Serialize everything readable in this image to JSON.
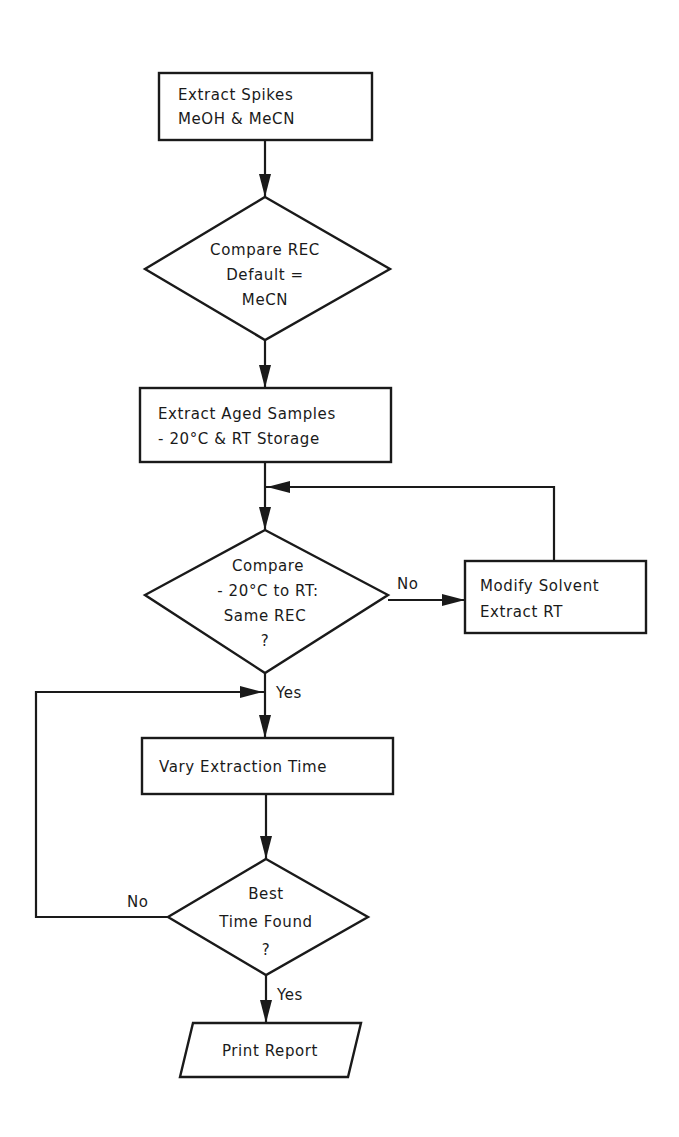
{
  "diagram": {
    "type": "flowchart",
    "nodes": [
      {
        "id": "extract_spikes",
        "shape": "process",
        "lines": [
          "Extract Spikes",
          "MeOH & MeCN"
        ]
      },
      {
        "id": "compare_rec_default",
        "shape": "decision",
        "lines": [
          "Compare REC",
          "Default =",
          "MeCN"
        ]
      },
      {
        "id": "extract_aged",
        "shape": "process",
        "lines": [
          "Extract Aged Samples",
          "- 20°C & RT Storage"
        ]
      },
      {
        "id": "compare_temps",
        "shape": "decision",
        "lines": [
          "Compare",
          "- 20°C to RT:",
          "Same REC",
          "?"
        ]
      },
      {
        "id": "modify_solvent",
        "shape": "process",
        "lines": [
          "Modify Solvent",
          "Extract RT"
        ]
      },
      {
        "id": "vary_time",
        "shape": "process",
        "lines": [
          "Vary Extraction Time"
        ]
      },
      {
        "id": "best_time",
        "shape": "decision",
        "lines": [
          "Best",
          "Time Found",
          "?"
        ]
      },
      {
        "id": "print_report",
        "shape": "io",
        "lines": [
          "Print Report"
        ]
      }
    ],
    "edges": [
      {
        "from": "extract_spikes",
        "to": "compare_rec_default",
        "label": ""
      },
      {
        "from": "compare_rec_default",
        "to": "extract_aged",
        "label": ""
      },
      {
        "from": "extract_aged",
        "to": "compare_temps",
        "label": ""
      },
      {
        "from": "compare_temps",
        "to": "modify_solvent",
        "label": "No"
      },
      {
        "from": "modify_solvent",
        "to": "compare_temps",
        "label": ""
      },
      {
        "from": "compare_temps",
        "to": "vary_time",
        "label": "Yes"
      },
      {
        "from": "vary_time",
        "to": "best_time",
        "label": ""
      },
      {
        "from": "best_time",
        "to": "vary_time",
        "label": "No"
      },
      {
        "from": "best_time",
        "to": "print_report",
        "label": "Yes"
      }
    ],
    "labels": {
      "no_1": "No",
      "yes_1": "Yes",
      "no_2": "No",
      "yes_2": "Yes"
    }
  }
}
